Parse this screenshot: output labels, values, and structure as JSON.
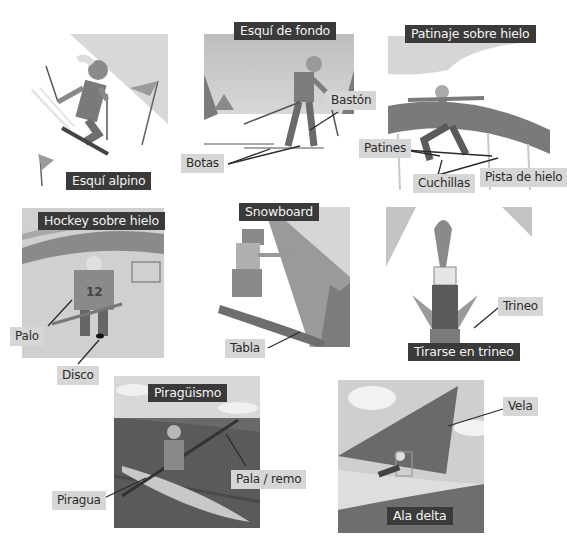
{
  "panels": [
    {
      "id": "esqui-alpino",
      "title": "Esquí alpino",
      "labels": []
    },
    {
      "id": "esqui-de-fondo",
      "title": "Esquí de fondo",
      "labels": [
        "Bastón",
        "Botas"
      ]
    },
    {
      "id": "patinaje-sobre-hielo",
      "title": "Patinaje sobre hielo",
      "labels": [
        "Patines",
        "Cuchillas",
        "Pista de hielo"
      ]
    },
    {
      "id": "hockey-sobre-hielo",
      "title": "Hockey sobre hielo",
      "labels": [
        "Palo",
        "Disco"
      ],
      "jersey_number": "12"
    },
    {
      "id": "snowboard",
      "title": "Snowboard",
      "labels": [
        "Tabla"
      ]
    },
    {
      "id": "tirarse-en-trineo",
      "title": "Tirarse en trineo",
      "labels": [
        "Trineo"
      ]
    },
    {
      "id": "piraguismo",
      "title": "Piragüismo",
      "labels": [
        "Piragua",
        "Pala / remo"
      ]
    },
    {
      "id": "ala-delta",
      "title": "Ala delta",
      "labels": [
        "Vela"
      ]
    }
  ],
  "colors": {
    "title_bg": "#3a3a3a",
    "title_text": "#f4f4f4",
    "label_bg": "#d6d6d6",
    "label_text": "#2a2a2a",
    "leader_line": "#2a2a2a"
  }
}
